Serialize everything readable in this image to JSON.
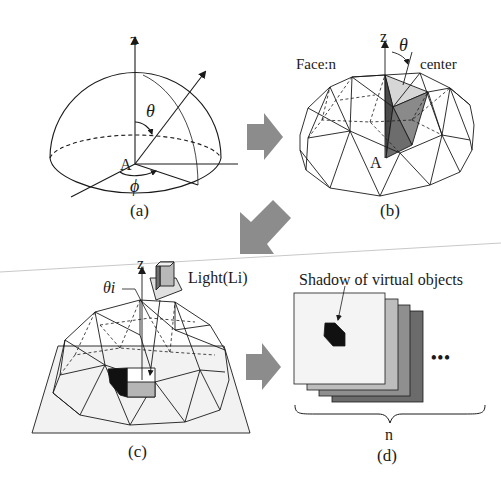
{
  "figure": {
    "panels": [
      {
        "id": "a",
        "caption": "(a)",
        "labels": {
          "z_axis": "z",
          "origin": "A",
          "polar_angle": "θ",
          "azimuth_angle": "ϕ"
        },
        "description": "Hemisphere with polar coordinate system centered at A"
      },
      {
        "id": "b",
        "caption": "(b)",
        "labels": {
          "z_axis": "z",
          "origin": "A",
          "polar_angle": "θ",
          "face": "Face:n",
          "center": "center"
        },
        "description": "Geodesic dome subdividing hemisphere; highlighted triangular face n"
      },
      {
        "id": "c",
        "caption": "(c)",
        "labels": {
          "z_axis": "z",
          "angle": "θi",
          "light": "Light(Li)"
        },
        "description": "Geodesic dome over plane with virtual object, lit by light source Li"
      },
      {
        "id": "d",
        "caption": "(d)",
        "labels": {
          "title": "Shadow of virtual objects",
          "ellipsis": "•••",
          "count": "n"
        },
        "description": "Stack of n shadow images"
      }
    ],
    "arrows": [
      {
        "from": "a",
        "to": "b",
        "direction": "right"
      },
      {
        "from": "b",
        "to": "c",
        "direction": "down-left"
      },
      {
        "from": "c",
        "to": "d",
        "direction": "right"
      }
    ],
    "colors": {
      "line": "#1a1a1a",
      "arrow_gray": "#8c8c8c",
      "face_light": "#d4d4d4",
      "face_mid": "#8a8a8a",
      "face_dark": "#4a4a4a",
      "plane": "#f2f2f2",
      "shadow": "#111111",
      "stack": [
        "#f4f4f4",
        "#bdbdbd",
        "#8f8f8f",
        "#6b6b6b"
      ]
    }
  }
}
